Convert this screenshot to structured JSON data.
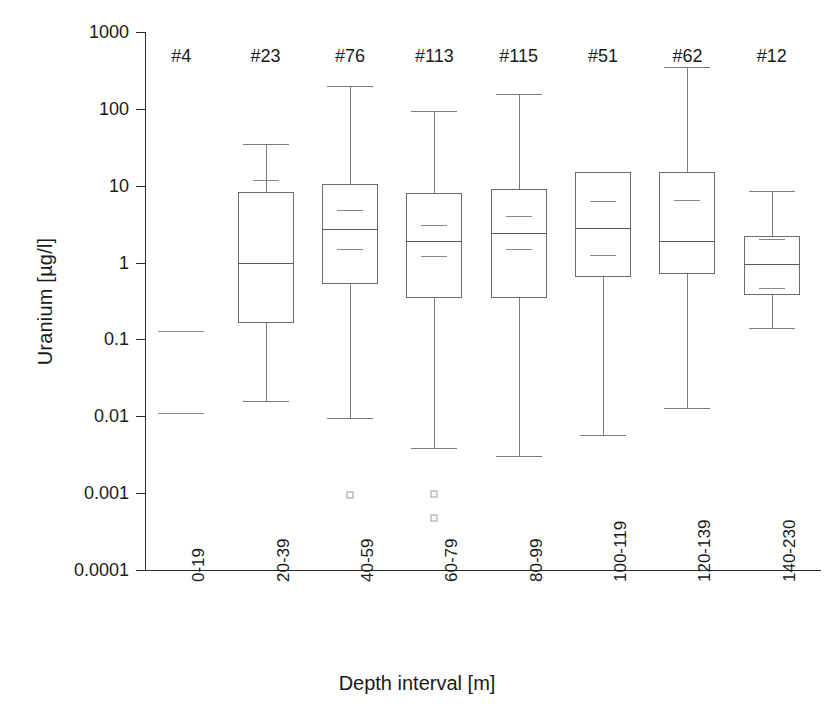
{
  "chart_data": {
    "type": "box",
    "title": "",
    "xlabel": "Depth interval [m]",
    "ylabel": "Uranium [µg/l]",
    "yscale": "log",
    "ylim": [
      0.0001,
      1000
    ],
    "ytick_labels": [
      "1000",
      "100",
      "10",
      "1",
      "0.1",
      "0.01",
      "0.001",
      "0.0001"
    ],
    "ytick_values": [
      1000,
      100,
      10,
      1,
      0.1,
      0.01,
      0.001,
      0.0001
    ],
    "grid": false,
    "legend": "none",
    "categories": [
      "0-19",
      "20-39",
      "40-59",
      "60-79",
      "80-99",
      "100-119",
      "120-139",
      "140-230"
    ],
    "counts": [
      "#4",
      "#23",
      "#76",
      "#113",
      "#115",
      "#51",
      "#62",
      "#12"
    ],
    "boxes": [
      {
        "category": "0-19",
        "count_label": "#4",
        "has_box": false,
        "marks": [
          0.13,
          0.011
        ],
        "whisker_low": null,
        "q1": null,
        "median": null,
        "mean": null,
        "q3": null,
        "whisker_high": null,
        "outliers": []
      },
      {
        "category": "20-39",
        "count_label": "#23",
        "has_box": true,
        "whisker_high": 35,
        "q3": 8.2,
        "mean": 12,
        "median": 1.0,
        "q1": 0.165,
        "whisker_low": 0.016,
        "outliers": []
      },
      {
        "category": "40-59",
        "count_label": "#76",
        "has_box": true,
        "whisker_high": 200,
        "q3": 10.5,
        "mean": 4.8,
        "median": 2.7,
        "secondary": 1.5,
        "q1": 0.52,
        "whisker_low": 0.0095,
        "outliers": [
          0.00095
        ]
      },
      {
        "category": "60-79",
        "count_label": "#113",
        "has_box": true,
        "whisker_high": 95,
        "q3": 8.0,
        "mean": 3.1,
        "median": 1.9,
        "secondary": 1.2,
        "q1": 0.35,
        "whisker_low": 0.0039,
        "outliers": [
          0.00098,
          0.00047
        ]
      },
      {
        "category": "80-99",
        "count_label": "#115",
        "has_box": true,
        "whisker_high": 155,
        "q3": 9.0,
        "mean": 4.0,
        "median": 2.4,
        "secondary": 1.5,
        "q1": 0.35,
        "whisker_low": 0.003,
        "outliers": []
      },
      {
        "category": "100-119",
        "count_label": "#51",
        "has_box": true,
        "whisker_high": null,
        "q3": 15,
        "mean": 6.3,
        "median": 2.8,
        "secondary": 1.25,
        "q1": 0.64,
        "whisker_low": 0.0057,
        "outliers": []
      },
      {
        "category": "120-139",
        "count_label": "#62",
        "has_box": true,
        "whisker_high": 350,
        "q3": 15,
        "mean": 6.6,
        "median": 1.9,
        "q1": 0.7,
        "whisker_low": 0.013,
        "outliers": []
      },
      {
        "category": "140-230",
        "count_label": "#12",
        "has_box": true,
        "whisker_high": 8.5,
        "q3": 2.2,
        "mean": 2.0,
        "median": 0.95,
        "secondary": 0.47,
        "q1": 0.38,
        "whisker_low": 0.14,
        "outliers": []
      }
    ]
  },
  "axes": {
    "y_label": "Uranium [µg/l]",
    "x_label": "Depth interval [m]"
  }
}
